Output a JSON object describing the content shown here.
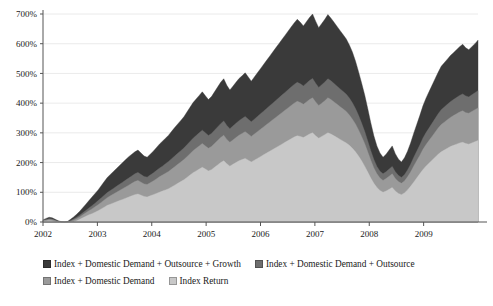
{
  "chart_data": {
    "type": "area",
    "stacked": true,
    "title": "",
    "xlabel": "",
    "ylabel": "",
    "ylim": [
      0,
      700
    ],
    "ytick_labels": [
      "0%",
      "100%",
      "200%",
      "300%",
      "400%",
      "500%",
      "600%",
      "700%"
    ],
    "ytick_values": [
      0,
      100,
      200,
      300,
      400,
      500,
      600,
      700
    ],
    "xtick_labels": [
      "2002",
      "2003",
      "2004",
      "2005",
      "2006",
      "2007",
      "2008",
      "2009"
    ],
    "xtick_values": [
      2002,
      2003,
      2004,
      2005,
      2006,
      2007,
      2008,
      2009
    ],
    "xlim": [
      2002,
      2010
    ],
    "grid": true,
    "grid_axis": "y",
    "legend_position": "bottom",
    "colors": {
      "index_return": "#c8c8c8",
      "index_domestic_demand": "#9a9a9a",
      "index_domestic_demand_outsource": "#6e6e6e",
      "index_domestic_demand_outsource_growth": "#3a3a3a",
      "grid": "#e4e4e4",
      "axis": "#555555",
      "text": "#1a1a1a"
    },
    "series": [
      {
        "name": "Index Return",
        "color": "#c8c8c8",
        "order": 1,
        "values": [
          2,
          3,
          4,
          3,
          1,
          -2,
          -4,
          -6,
          -5,
          -3,
          0,
          4,
          9,
          14,
          19,
          24,
          28,
          33,
          38,
          44,
          50,
          56,
          60,
          64,
          68,
          72,
          76,
          80,
          84,
          88,
          92,
          94,
          90,
          86,
          84,
          88,
          92,
          96,
          100,
          104,
          108,
          112,
          118,
          124,
          130,
          136,
          142,
          150,
          158,
          166,
          172,
          178,
          184,
          178,
          172,
          176,
          184,
          192,
          200,
          206,
          196,
          188,
          194,
          200,
          206,
          210,
          214,
          208,
          202,
          208,
          214,
          220,
          226,
          232,
          238,
          244,
          250,
          256,
          262,
          268,
          274,
          280,
          286,
          290,
          288,
          284,
          290,
          296,
          300,
          290,
          282,
          288,
          294,
          300,
          296,
          290,
          284,
          278,
          272,
          266,
          258,
          248,
          236,
          222,
          206,
          188,
          168,
          148,
          130,
          116,
          106,
          100,
          104,
          110,
          116,
          104,
          96,
          92,
          98,
          108,
          120,
          134,
          148,
          162,
          176,
          188,
          198,
          208,
          218,
          228,
          236,
          242,
          248,
          254,
          258,
          262,
          266,
          268,
          264,
          262,
          266,
          270,
          274
        ]
      },
      {
        "name": "Index + Domestic Demand",
        "color": "#9a9a9a",
        "order": 2,
        "values": [
          4,
          6,
          8,
          7,
          4,
          1,
          -2,
          -4,
          -2,
          2,
          6,
          11,
          17,
          24,
          31,
          38,
          44,
          51,
          58,
          66,
          74,
          82,
          88,
          94,
          100,
          106,
          112,
          118,
          124,
          130,
          136,
          140,
          134,
          128,
          126,
          132,
          138,
          145,
          152,
          158,
          164,
          170,
          178,
          186,
          194,
          202,
          210,
          220,
          230,
          240,
          248,
          256,
          264,
          256,
          248,
          254,
          264,
          274,
          284,
          292,
          278,
          268,
          276,
          284,
          292,
          298,
          304,
          296,
          288,
          296,
          304,
          312,
          320,
          328,
          336,
          344,
          352,
          360,
          368,
          376,
          384,
          392,
          400,
          406,
          402,
          396,
          404,
          412,
          418,
          404,
          392,
          400,
          408,
          418,
          412,
          404,
          396,
          388,
          380,
          372,
          360,
          346,
          330,
          310,
          288,
          264,
          236,
          208,
          182,
          162,
          148,
          140,
          146,
          154,
          162,
          146,
          136,
          130,
          138,
          152,
          168,
          188,
          206,
          224,
          244,
          260,
          274,
          288,
          302,
          316,
          328,
          336,
          344,
          352,
          358,
          364,
          370,
          374,
          368,
          366,
          372,
          378,
          384
        ]
      },
      {
        "name": "Index + Domestic Demand + Outsource",
        "color": "#6e6e6e",
        "order": 3,
        "values": [
          5,
          8,
          11,
          10,
          6,
          2,
          -1,
          -3,
          0,
          5,
          10,
          16,
          23,
          31,
          39,
          47,
          55,
          63,
          72,
          81,
          90,
          99,
          106,
          113,
          120,
          127,
          134,
          141,
          148,
          155,
          162,
          167,
          160,
          153,
          151,
          158,
          165,
          173,
          181,
          188,
          196,
          204,
          213,
          222,
          231,
          240,
          249,
          260,
          271,
          282,
          291,
          300,
          309,
          300,
          291,
          298,
          309,
          320,
          331,
          340,
          325,
          314,
          323,
          332,
          341,
          348,
          355,
          346,
          337,
          346,
          355,
          364,
          373,
          382,
          391,
          400,
          409,
          418,
          427,
          436,
          445,
          454,
          463,
          470,
          465,
          458,
          467,
          476,
          483,
          467,
          453,
          462,
          471,
          482,
          475,
          466,
          457,
          448,
          439,
          430,
          417,
          401,
          382,
          359,
          333,
          305,
          273,
          240,
          210,
          187,
          171,
          162,
          169,
          178,
          187,
          169,
          157,
          150,
          159,
          175,
          194,
          217,
          238,
          259,
          282,
          300,
          316,
          332,
          348,
          364,
          378,
          387,
          396,
          405,
          412,
          419,
          426,
          431,
          424,
          421,
          428,
          435,
          442
        ]
      },
      {
        "name": "Index + Domestic Demand + Outsource + Growth",
        "color": "#3a3a3a",
        "order": 4,
        "values": [
          7,
          12,
          16,
          14,
          9,
          4,
          1,
          -2,
          2,
          9,
          17,
          26,
          36,
          48,
          60,
          72,
          84,
          96,
          108,
          122,
          136,
          150,
          160,
          170,
          180,
          190,
          200,
          210,
          220,
          228,
          236,
          242,
          232,
          222,
          218,
          228,
          238,
          250,
          262,
          272,
          282,
          292,
          305,
          318,
          330,
          342,
          354,
          370,
          386,
          402,
          414,
          426,
          438,
          425,
          412,
          422,
          438,
          454,
          470,
          482,
          460,
          444,
          457,
          470,
          483,
          492,
          502,
          488,
          474,
          488,
          502,
          516,
          530,
          544,
          558,
          572,
          586,
          600,
          614,
          628,
          642,
          656,
          670,
          682,
          672,
          660,
          674,
          688,
          700,
          676,
          654,
          668,
          682,
          698,
          686,
          672,
          658,
          644,
          630,
          616,
          596,
          572,
          542,
          506,
          468,
          428,
          382,
          334,
          290,
          256,
          232,
          218,
          228,
          242,
          256,
          230,
          212,
          202,
          216,
          238,
          266,
          298,
          328,
          358,
          390,
          416,
          438,
          460,
          482,
          504,
          524,
          536,
          548,
          560,
          570,
          580,
          590,
          598,
          586,
          580,
          590,
          600,
          612
        ]
      }
    ]
  },
  "legend": {
    "rows": [
      [
        {
          "label": "Index + Domestic Demand + Outsource + Growth",
          "color": "#3a3a3a"
        },
        {
          "label": "Index + Domestic Demand + Outsource",
          "color": "#6e6e6e"
        }
      ],
      [
        {
          "label": "Index + Domestic Demand",
          "color": "#9a9a9a"
        },
        {
          "label": "Index Return",
          "color": "#c8c8c8"
        }
      ]
    ]
  }
}
